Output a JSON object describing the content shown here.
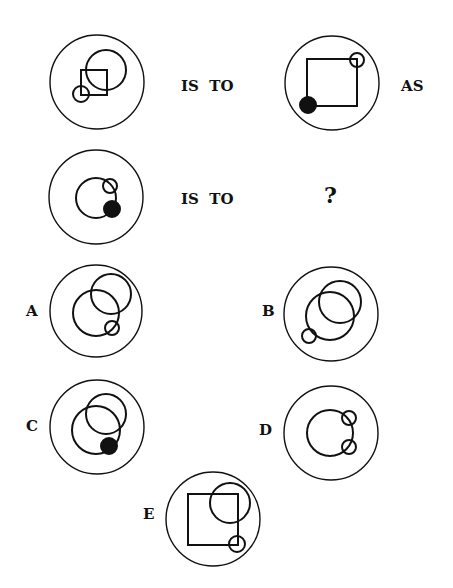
{
  "puzzle": {
    "row1": {
      "connector1": "IS  TO",
      "connector2": "AS"
    },
    "row2": {
      "connector1": "IS  TO",
      "unknown": "?"
    },
    "options": [
      {
        "label": "A"
      },
      {
        "label": "B"
      },
      {
        "label": "C"
      },
      {
        "label": "D"
      },
      {
        "label": "E"
      }
    ]
  },
  "style": {
    "stroke_color": "#111111",
    "background": "#ffffff"
  },
  "figures": {
    "row1_left": {
      "frame": {
        "cx": 97,
        "cy": 82,
        "r": 47
      },
      "shapes": [
        {
          "type": "circle",
          "cx": 106,
          "cy": 70,
          "r": 20,
          "fill": "none"
        },
        {
          "type": "square",
          "x": 81,
          "y": 70,
          "w": 26,
          "h": 25
        },
        {
          "type": "circle",
          "cx": 81,
          "cy": 94,
          "r": 8,
          "fill": "none"
        }
      ]
    },
    "row1_right": {
      "frame": {
        "cx": 332,
        "cy": 83,
        "r": 47
      },
      "shapes": [
        {
          "type": "square",
          "x": 307,
          "y": 59,
          "w": 50,
          "h": 47
        },
        {
          "type": "circle",
          "cx": 357,
          "cy": 60,
          "r": 7,
          "fill": "none"
        },
        {
          "type": "circle",
          "cx": 308,
          "cy": 105,
          "r": 8,
          "fill": "solid"
        }
      ]
    },
    "row2_left": {
      "frame": {
        "cx": 96,
        "cy": 197,
        "r": 47
      },
      "shapes": [
        {
          "type": "circle",
          "cx": 96,
          "cy": 198,
          "r": 20,
          "fill": "none"
        },
        {
          "type": "circle",
          "cx": 110,
          "cy": 186,
          "r": 7,
          "fill": "none"
        },
        {
          "type": "circle",
          "cx": 112,
          "cy": 209,
          "r": 8,
          "fill": "solid"
        }
      ]
    },
    "option_A": {
      "frame": {
        "cx": 96,
        "cy": 311,
        "r": 46
      },
      "shapes": [
        {
          "type": "circle",
          "cx": 96,
          "cy": 313,
          "r": 23,
          "fill": "none"
        },
        {
          "type": "circle",
          "cx": 111,
          "cy": 294,
          "r": 20,
          "fill": "none"
        },
        {
          "type": "circle",
          "cx": 112,
          "cy": 328,
          "r": 7,
          "fill": "none"
        }
      ]
    },
    "option_B": {
      "frame": {
        "cx": 331,
        "cy": 314,
        "r": 47
      },
      "shapes": [
        {
          "type": "circle",
          "cx": 330,
          "cy": 316,
          "r": 24,
          "fill": "none"
        },
        {
          "type": "circle",
          "cx": 340,
          "cy": 302,
          "r": 21,
          "fill": "none"
        },
        {
          "type": "circle",
          "cx": 309,
          "cy": 336,
          "r": 7,
          "fill": "none"
        }
      ]
    },
    "option_C": {
      "frame": {
        "cx": 97,
        "cy": 427,
        "r": 47
      },
      "shapes": [
        {
          "type": "circle",
          "cx": 96,
          "cy": 430,
          "r": 24,
          "fill": "none"
        },
        {
          "type": "circle",
          "cx": 106,
          "cy": 414,
          "r": 20,
          "fill": "none"
        },
        {
          "type": "circle",
          "cx": 109,
          "cy": 446,
          "r": 8,
          "fill": "solid"
        }
      ]
    },
    "option_D": {
      "frame": {
        "cx": 331,
        "cy": 433,
        "r": 47
      },
      "shapes": [
        {
          "type": "circle",
          "cx": 330,
          "cy": 433,
          "r": 23,
          "fill": "none"
        },
        {
          "type": "circle",
          "cx": 349,
          "cy": 418,
          "r": 7,
          "fill": "none"
        },
        {
          "type": "circle",
          "cx": 349,
          "cy": 447,
          "r": 7,
          "fill": "none"
        }
      ]
    },
    "option_E": {
      "frame": {
        "cx": 213,
        "cy": 519,
        "r": 47
      },
      "shapes": [
        {
          "type": "square",
          "x": 188,
          "y": 494,
          "w": 50,
          "h": 51
        },
        {
          "type": "circle",
          "cx": 230,
          "cy": 503,
          "r": 20,
          "fill": "none"
        },
        {
          "type": "circle",
          "cx": 237,
          "cy": 544,
          "r": 8,
          "fill": "none"
        }
      ]
    }
  }
}
